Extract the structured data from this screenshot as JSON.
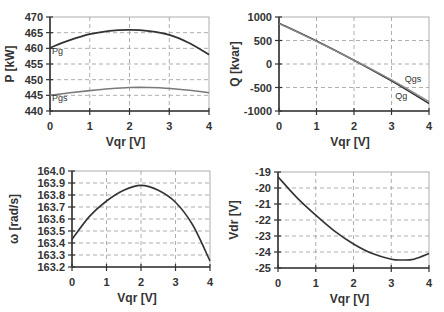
{
  "chart_data": [
    {
      "id": "p",
      "type": "line",
      "title": "",
      "xlabel": "Vqr [V]",
      "ylabel": "P [kW]",
      "xlim": [
        0,
        4
      ],
      "ylim": [
        440,
        470
      ],
      "xticks": [
        0,
        1,
        2,
        3,
        4
      ],
      "yticks": [
        440,
        445,
        450,
        455,
        460,
        465,
        470
      ],
      "grid": true,
      "x": [
        0,
        0.5,
        1,
        1.5,
        2,
        2.5,
        3,
        3.5,
        4
      ],
      "series": [
        {
          "name": "Pg",
          "color": "#333333",
          "width": 1.8,
          "values": [
            460.2,
            462.6,
            464.5,
            465.6,
            465.9,
            465.5,
            464.3,
            461.7,
            458.0
          ],
          "label_pos": [
            0.05,
            458.2
          ]
        },
        {
          "name": "Pgs",
          "color": "#7a7a7a",
          "width": 1.6,
          "values": [
            445.0,
            445.8,
            446.5,
            447.1,
            447.5,
            447.5,
            447.2,
            446.6,
            445.8
          ],
          "label_pos": [
            0.05,
            443.2
          ]
        }
      ],
      "box": {
        "left": 50,
        "top": 17,
        "right": 209,
        "bottom": 111
      }
    },
    {
      "id": "q",
      "type": "line",
      "title": "",
      "xlabel": "Vqr [V]",
      "ylabel": "Q [kvar]",
      "xlim": [
        0,
        4
      ],
      "ylim": [
        -1000,
        1000
      ],
      "xticks": [
        0,
        1,
        2,
        3,
        4
      ],
      "yticks": [
        -1000,
        -500,
        0,
        500,
        1000
      ],
      "grid": true,
      "x": [
        0,
        1,
        2,
        3,
        4
      ],
      "series": [
        {
          "name": "Qg",
          "color": "#333333",
          "width": 1.6,
          "values": [
            870,
            490,
            80,
            -360,
            -840
          ],
          "label_pos": [
            3.1,
            -740
          ]
        },
        {
          "name": "Qgs",
          "color": "#8a8a8a",
          "width": 1.4,
          "values": [
            860,
            480,
            80,
            -340,
            -800
          ],
          "label_pos": [
            3.35,
            -380
          ]
        }
      ],
      "box": {
        "left": 279,
        "top": 17,
        "right": 429,
        "bottom": 111
      }
    },
    {
      "id": "omega",
      "type": "line",
      "title": "",
      "xlabel": "Vqr [V]",
      "ylabel": "ω [rad/s]",
      "xlim": [
        0,
        4
      ],
      "ylim": [
        163.2,
        164.0
      ],
      "xticks": [
        0,
        1,
        2,
        3,
        4
      ],
      "yticks": [
        163.2,
        163.3,
        163.4,
        163.5,
        163.6,
        163.7,
        163.8,
        163.9,
        164.0
      ],
      "grid": true,
      "x": [
        0,
        0.5,
        1,
        1.5,
        2,
        2.5,
        3,
        3.5,
        4
      ],
      "series": [
        {
          "name": "omega",
          "color": "#333333",
          "width": 1.6,
          "values": [
            163.43,
            163.62,
            163.75,
            163.84,
            163.88,
            163.84,
            163.74,
            163.55,
            163.25
          ]
        }
      ],
      "box": {
        "left": 72,
        "top": 171,
        "right": 210,
        "bottom": 267
      }
    },
    {
      "id": "vdr",
      "type": "line",
      "title": "",
      "xlabel": "Vqr [V]",
      "ylabel": "Vdr [V]",
      "xlim": [
        0,
        4
      ],
      "ylim": [
        -25,
        -19
      ],
      "xticks": [
        0,
        1,
        2,
        3,
        4
      ],
      "yticks": [
        -25,
        -24,
        -23,
        -22,
        -21,
        -20,
        -19
      ],
      "grid": true,
      "x": [
        0,
        0.5,
        1,
        1.5,
        2,
        2.5,
        3,
        3.3,
        3.6,
        4
      ],
      "series": [
        {
          "name": "Vdr",
          "color": "#333333",
          "width": 1.6,
          "values": [
            -19.3,
            -20.6,
            -21.7,
            -22.7,
            -23.5,
            -24.1,
            -24.45,
            -24.5,
            -24.45,
            -24.1
          ]
        }
      ],
      "box": {
        "left": 278,
        "top": 172,
        "right": 429,
        "bottom": 268
      }
    }
  ]
}
